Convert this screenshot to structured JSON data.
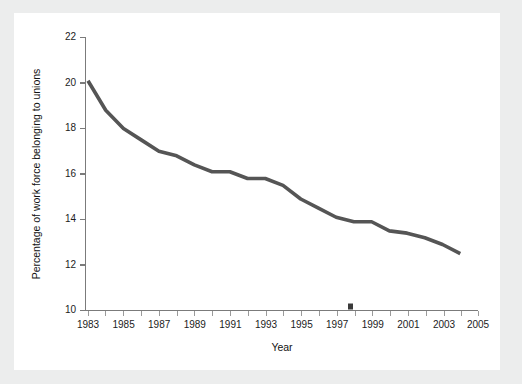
{
  "chart_data": {
    "type": "line",
    "title": "",
    "xlabel": "Year",
    "ylabel": "Percentage of work force belonging to unions",
    "xlim": [
      1983,
      2005
    ],
    "ylim": [
      10,
      22
    ],
    "grid": false,
    "legend": false,
    "y_ticks": [
      10,
      12,
      14,
      16,
      18,
      20,
      22
    ],
    "y_tick_labels": [
      "10",
      "12",
      "14",
      "16",
      "18",
      "20",
      "22"
    ],
    "x_ticks": [
      1983,
      1984,
      1985,
      1986,
      1987,
      1988,
      1989,
      1990,
      1991,
      1992,
      1993,
      1994,
      1995,
      1996,
      1997,
      1998,
      1999,
      2000,
      2001,
      2002,
      2003,
      2004,
      2005
    ],
    "x_tick_labels": [
      "1983",
      "",
      "1985",
      "",
      "1987",
      "",
      "1989",
      "",
      "1991",
      "",
      "1993",
      "",
      "1995",
      "",
      "1997",
      "",
      "1999",
      "",
      "2001",
      "",
      "2003",
      "",
      "2005"
    ],
    "x": [
      1983,
      1984,
      1985,
      1986,
      1987,
      1988,
      1989,
      1990,
      1991,
      1992,
      1993,
      1994,
      1995,
      1996,
      1997,
      1998,
      1999,
      2000,
      2001,
      2002,
      2003,
      2004
    ],
    "values": [
      20.1,
      18.8,
      18.0,
      17.5,
      17.0,
      16.8,
      16.4,
      16.1,
      16.1,
      15.8,
      15.8,
      15.5,
      14.9,
      14.5,
      14.1,
      13.9,
      13.9,
      13.5,
      13.4,
      13.2,
      12.9,
      12.5
    ],
    "series": [
      {
        "name": "Percentage of work force belonging to unions",
        "color": "#555555",
        "values": [
          20.1,
          18.8,
          18.0,
          17.5,
          17.0,
          16.8,
          16.4,
          16.1,
          16.1,
          15.8,
          15.8,
          15.5,
          14.9,
          14.5,
          14.1,
          13.9,
          13.9,
          13.5,
          13.4,
          13.2,
          12.9,
          12.5
        ]
      }
    ],
    "annotations": [
      {
        "name": "axis-smudge",
        "x": 1998,
        "y": 10.15
      }
    ]
  },
  "figure": {
    "background_color": "#eceded",
    "panel_color": "#ffffff",
    "axis_color": "#7b7b7b",
    "text_color": "#1c1c1c"
  }
}
